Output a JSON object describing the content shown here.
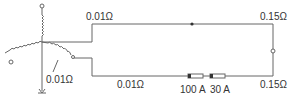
{
  "diagram": {
    "type": "circuit",
    "labels": {
      "top_left_resistance": "0.01Ω",
      "top_right_resistance": "0.15Ω",
      "earth_resistance": "0.01Ω",
      "bottom_left_resistance": "0.01Ω",
      "bottom_right_resistance": "0.15Ω",
      "fuse_1_rating": "100 A",
      "fuse_2_rating": "30 A"
    },
    "colors": {
      "line": "#666666",
      "text": "#333333"
    }
  }
}
